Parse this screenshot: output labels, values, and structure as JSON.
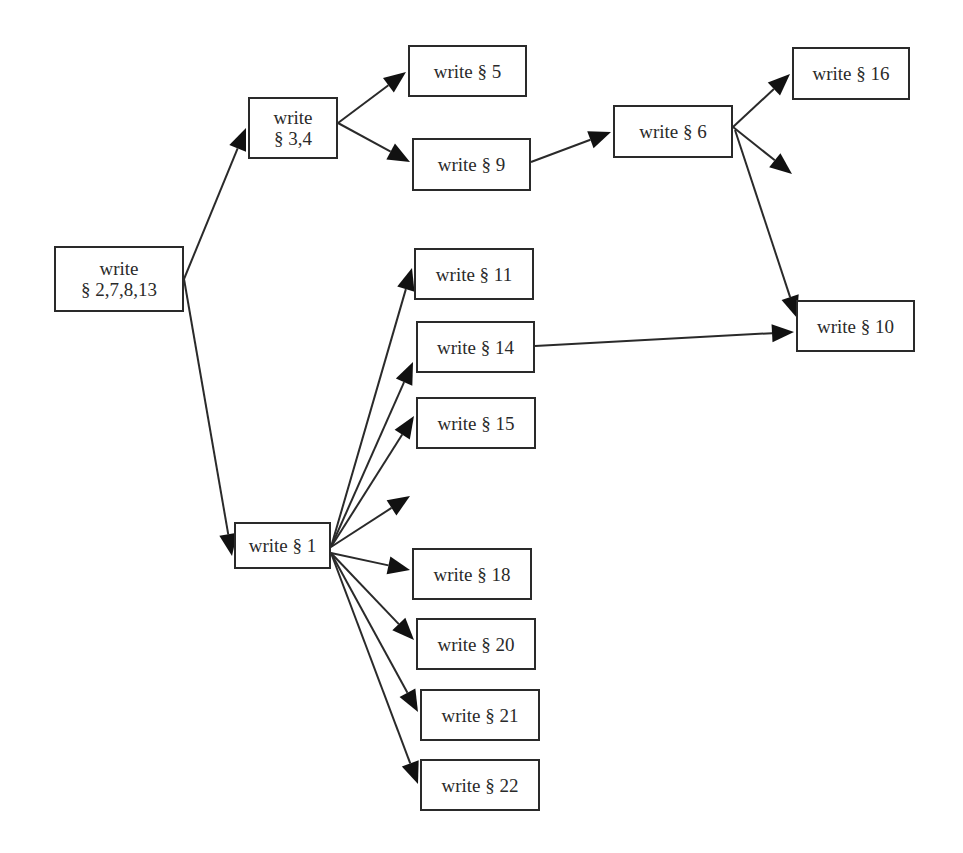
{
  "diagram": {
    "type": "dependency-flowchart",
    "colors": {
      "line": "#2a2a2a",
      "box_border": "#2a2a2a",
      "box_fill": "#ffffff",
      "text": "#2a2a2a",
      "background": "#ffffff"
    },
    "nodes": [
      {
        "id": "n2_7_8_13",
        "label": "write\n§ 2,7,8,13",
        "x": 54,
        "y": 246,
        "w": 130,
        "h": 66
      },
      {
        "id": "n3_4",
        "label": "write\n§ 3,4",
        "x": 248,
        "y": 97,
        "w": 90,
        "h": 62
      },
      {
        "id": "n5",
        "label": "write § 5",
        "x": 408,
        "y": 45,
        "w": 119,
        "h": 52
      },
      {
        "id": "n9",
        "label": "write § 9",
        "x": 412,
        "y": 138,
        "w": 119,
        "h": 53
      },
      {
        "id": "n6",
        "label": "write § 6",
        "x": 613,
        "y": 105,
        "w": 120,
        "h": 53
      },
      {
        "id": "n16",
        "label": "write § 16",
        "x": 792,
        "y": 47,
        "w": 118,
        "h": 53
      },
      {
        "id": "n10",
        "label": "write § 10",
        "x": 796,
        "y": 300,
        "w": 119,
        "h": 52
      },
      {
        "id": "n11",
        "label": "write § 11",
        "x": 414,
        "y": 248,
        "w": 120,
        "h": 52
      },
      {
        "id": "n14",
        "label": "write § 14",
        "x": 416,
        "y": 321,
        "w": 119,
        "h": 52
      },
      {
        "id": "n15",
        "label": "write § 15",
        "x": 416,
        "y": 397,
        "w": 120,
        "h": 52
      },
      {
        "id": "n1",
        "label": "write § 1",
        "x": 234,
        "y": 522,
        "w": 97,
        "h": 47
      },
      {
        "id": "n18",
        "label": "write § 18",
        "x": 412,
        "y": 548,
        "w": 120,
        "h": 52
      },
      {
        "id": "n20",
        "label": "write § 20",
        "x": 416,
        "y": 618,
        "w": 120,
        "h": 52
      },
      {
        "id": "n21",
        "label": "write § 21",
        "x": 420,
        "y": 689,
        "w": 120,
        "h": 52
      },
      {
        "id": "n22",
        "label": "write § 22",
        "x": 420,
        "y": 759,
        "w": 120,
        "h": 52
      }
    ],
    "edges": [
      {
        "from": "n2_7_8_13",
        "to": "n3_4",
        "x1": 184,
        "y1": 279,
        "x2": 246,
        "y2": 128
      },
      {
        "from": "n2_7_8_13",
        "to": "n1",
        "x1": 184,
        "y1": 279,
        "x2": 232,
        "y2": 556
      },
      {
        "from": "n3_4",
        "to": "n5",
        "x1": 338,
        "y1": 123,
        "x2": 406,
        "y2": 72
      },
      {
        "from": "n3_4",
        "to": "n9",
        "x1": 338,
        "y1": 123,
        "x2": 410,
        "y2": 162
      },
      {
        "from": "n9",
        "to": "n6",
        "x1": 531,
        "y1": 162,
        "x2": 611,
        "y2": 132
      },
      {
        "from": "n6",
        "to": "n16",
        "x1": 733,
        "y1": 127,
        "x2": 790,
        "y2": 74
      },
      {
        "from": "n6",
        "to": null,
        "x1": 733,
        "y1": 127,
        "x2": 792,
        "y2": 174
      },
      {
        "from": "n6",
        "to": "n10",
        "x1": 735,
        "y1": 130,
        "x2": 797,
        "y2": 318
      },
      {
        "from": "n14",
        "to": "n10",
        "x1": 535,
        "y1": 346,
        "x2": 794,
        "y2": 332
      },
      {
        "from": "n1",
        "to": "n11",
        "x1": 331,
        "y1": 547,
        "x2": 412,
        "y2": 268
      },
      {
        "from": "n1",
        "to": "n14",
        "x1": 331,
        "y1": 547,
        "x2": 413,
        "y2": 362
      },
      {
        "from": "n1",
        "to": "n15",
        "x1": 331,
        "y1": 547,
        "x2": 414,
        "y2": 416
      },
      {
        "from": "n1",
        "to": null,
        "x1": 331,
        "y1": 547,
        "x2": 410,
        "y2": 496
      },
      {
        "from": "n1",
        "to": "n18",
        "x1": 331,
        "y1": 553,
        "x2": 410,
        "y2": 570
      },
      {
        "from": "n1",
        "to": "n20",
        "x1": 331,
        "y1": 553,
        "x2": 414,
        "y2": 640
      },
      {
        "from": "n1",
        "to": "n21",
        "x1": 331,
        "y1": 553,
        "x2": 418,
        "y2": 712
      },
      {
        "from": "n1",
        "to": "n22",
        "x1": 331,
        "y1": 553,
        "x2": 418,
        "y2": 784
      }
    ]
  }
}
